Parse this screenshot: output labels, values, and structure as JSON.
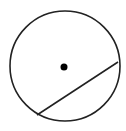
{
  "diagram": {
    "type": "circle-with-chord",
    "canvas": {
      "width": 126,
      "height": 131,
      "background": "#ffffff"
    },
    "circle": {
      "cx": 65,
      "cy": 66,
      "r": 55,
      "stroke": "#222222",
      "stroke_width": 1.6
    },
    "center_point": {
      "cx": 64,
      "cy": 67,
      "r": 3.5,
      "fill": "#000000"
    },
    "chord": {
      "x1": 37,
      "y1": 115,
      "x2": 118,
      "y2": 62,
      "stroke": "#222222",
      "stroke_width": 1.6
    }
  }
}
